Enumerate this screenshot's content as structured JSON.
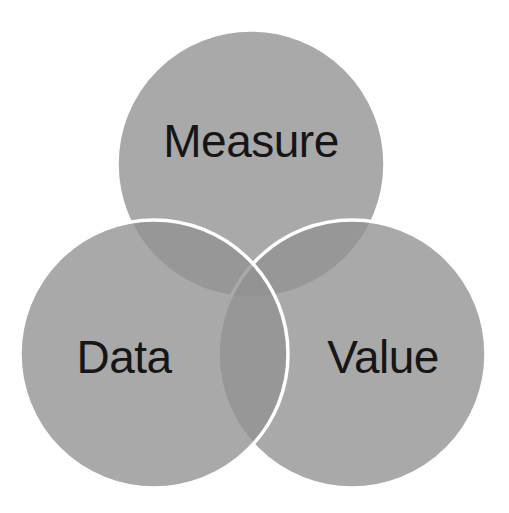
{
  "diagram": {
    "type": "venn",
    "fill_color": "#929292",
    "fill_opacity": 0.79,
    "stroke_color": "#ffffff",
    "text_color": "#161616",
    "background": "#ffffff",
    "sets": [
      {
        "id": "measure",
        "label": "Measure"
      },
      {
        "id": "value",
        "label": "Value"
      },
      {
        "id": "data",
        "label": "Data"
      }
    ]
  }
}
